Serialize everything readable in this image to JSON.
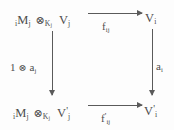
{
  "diagram": {
    "kind": "commutative-square",
    "background_color": "#fdfdfd",
    "ink_color": "#4d4d4d",
    "arrow_color": "#5a5a5a",
    "nodes": {
      "top_left": {
        "name": "tensor-product-M-V",
        "plain": "iMj ⊗Kj Vj",
        "presub": "i",
        "module": "M",
        "module_sub": "j",
        "tensor": "⊗",
        "tensor_sub": "K",
        "tensor_sub_sub": "j",
        "space": "V",
        "space_sub": "j",
        "prime": ""
      },
      "top_right": {
        "name": "space-V-i",
        "plain": "Vi",
        "space": "V",
        "space_sub": "i",
        "prime": ""
      },
      "bottom_left": {
        "name": "tensor-product-M-V-prime",
        "plain": "iMj ⊗Kj V'j",
        "presub": "i",
        "module": "M",
        "module_sub": "j",
        "tensor": "⊗",
        "tensor_sub": "K",
        "tensor_sub_sub": "j",
        "space": "V",
        "space_sub": "j",
        "prime": "'"
      },
      "bottom_right": {
        "name": "space-V-i-prime",
        "plain": "V'i",
        "space": "V",
        "space_sub": "i",
        "prime": "'"
      }
    },
    "arrows": {
      "top": {
        "name": "map-f-ij",
        "direction": "right",
        "label_plain": "fij",
        "label_main": "f",
        "label_sub": "ij",
        "label_prime": ""
      },
      "bottom": {
        "name": "map-f-ij-prime",
        "direction": "right",
        "label_plain": "f'ij",
        "label_main": "f",
        "label_sub": "ij",
        "label_prime": "'"
      },
      "left": {
        "name": "map-one-tensor-a-j",
        "direction": "down",
        "label_plain": "1 ⊗ aj",
        "label_identity": "1",
        "label_tensor": "⊗",
        "label_main": "a",
        "label_sub": "j"
      },
      "right": {
        "name": "map-a-i",
        "direction": "down",
        "label_plain": "ai",
        "label_main": "a",
        "label_sub": "i"
      }
    }
  }
}
